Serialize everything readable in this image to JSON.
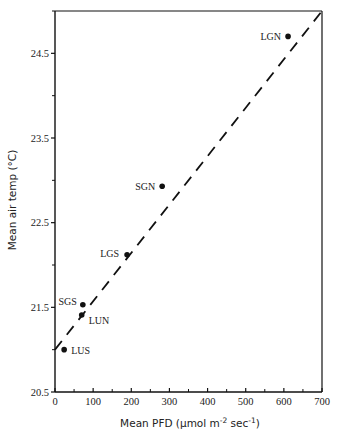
{
  "chart_data": {
    "type": "scatter",
    "title": "",
    "xlabel": "Mean PFD (µmol m^-2 sec^-1)",
    "xlabel_main": "Mean PFD (µmol m",
    "xlabel_sup1": "-2",
    "xlabel_mid": " sec",
    "xlabel_sup2": "-1",
    "xlabel_end": ")",
    "ylabel": "Mean air temp (°C)",
    "xlim": [
      0,
      700
    ],
    "ylim": [
      20.5,
      25.0
    ],
    "xticks": [
      0,
      100,
      200,
      300,
      400,
      500,
      600,
      700
    ],
    "xtick_labels": [
      "0",
      "100",
      "200",
      "300",
      "400",
      "500",
      "600",
      "700"
    ],
    "yticks": [
      20.5,
      21.5,
      22.5,
      23.5,
      24.5
    ],
    "ytick_labels": [
      "20.5",
      "21.5",
      "22.5",
      "23.5",
      "24.5"
    ],
    "grid": false,
    "legend": null,
    "points": [
      {
        "label": "LUS",
        "x": 24,
        "y": 21.0
      },
      {
        "label": "LUN",
        "x": 70,
        "y": 21.41
      },
      {
        "label": "SGS",
        "x": 73,
        "y": 21.53
      },
      {
        "label": "LGS",
        "x": 189,
        "y": 22.12
      },
      {
        "label": "SGN",
        "x": 281,
        "y": 22.93
      },
      {
        "label": "LGN",
        "x": 611,
        "y": 24.7
      }
    ],
    "fit_line": {
      "style": "dashed",
      "x": [
        0,
        700
      ],
      "y": [
        21.0,
        25.0
      ]
    }
  }
}
